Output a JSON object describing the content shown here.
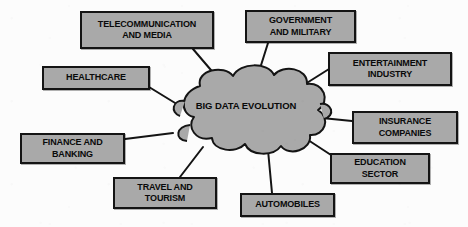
{
  "diagram": {
    "type": "hub-and-spoke",
    "background_color": "#fcfcfc",
    "node_fill_color": "#a9a9a9",
    "node_border_color": "#141414",
    "text_color": "#0a0a0a",
    "connector_color": "#141414"
  },
  "hub": {
    "label": "BIG DATA EVOLUTION",
    "shape": "cloud"
  },
  "nodes": [
    {
      "id": "telecommunication-and-media",
      "label": "TELECOMMUNICATION\nAND MEDIA",
      "x": 80,
      "y": 11,
      "width": 134,
      "height": 38
    },
    {
      "id": "government-and-military",
      "label": "GOVERNMENT\nAND MILITARY",
      "x": 245,
      "y": 10,
      "width": 111,
      "height": 33
    },
    {
      "id": "entertainment-industry",
      "label": "ENTERTAINMENT\nINDUSTRY",
      "x": 328,
      "y": 52,
      "width": 124,
      "height": 34
    },
    {
      "id": "healthcare",
      "label": "HEALTHCARE",
      "x": 42,
      "y": 66,
      "width": 108,
      "height": 24
    },
    {
      "id": "insurance-companies",
      "label": "INSURANCE\nCOMPANIES",
      "x": 352,
      "y": 111,
      "width": 106,
      "height": 33
    },
    {
      "id": "finance-and-banking",
      "label": "FINANCE AND\nBANKING",
      "x": 20,
      "y": 133,
      "width": 105,
      "height": 31
    },
    {
      "id": "education-sector",
      "label": "EDUCATION\nSECTOR",
      "x": 330,
      "y": 153,
      "width": 100,
      "height": 31
    },
    {
      "id": "travel-and-tourism",
      "label": "TRAVEL AND\nTOURISM",
      "x": 113,
      "y": 177,
      "width": 104,
      "height": 32
    },
    {
      "id": "automobiles",
      "label": "AUTOMOBILES",
      "x": 240,
      "y": 193,
      "width": 95,
      "height": 24
    }
  ],
  "connectors": [
    {
      "from": "telecommunication-and-media",
      "to": "hub",
      "x1": 193,
      "y1": 49,
      "x2": 222,
      "y2": 83
    },
    {
      "from": "government-and-military",
      "to": "hub",
      "x1": 268,
      "y1": 43,
      "x2": 257,
      "y2": 78
    },
    {
      "from": "entertainment-industry",
      "to": "hub",
      "x1": 329,
      "y1": 69,
      "x2": 302,
      "y2": 86
    },
    {
      "from": "healthcare",
      "to": "hub",
      "x1": 149,
      "y1": 87,
      "x2": 180,
      "y2": 106
    },
    {
      "from": "insurance-companies",
      "to": "hub",
      "x1": 352,
      "y1": 121,
      "x2": 322,
      "y2": 118
    },
    {
      "from": "finance-and-banking",
      "to": "hub",
      "x1": 125,
      "y1": 139,
      "x2": 173,
      "y2": 133
    },
    {
      "from": "education-sector",
      "to": "hub",
      "x1": 331,
      "y1": 155,
      "x2": 305,
      "y2": 138
    },
    {
      "from": "travel-and-tourism",
      "to": "hub",
      "x1": 180,
      "y1": 177,
      "x2": 203,
      "y2": 147
    },
    {
      "from": "automobiles",
      "to": "hub",
      "x1": 272,
      "y1": 193,
      "x2": 268,
      "y2": 150
    }
  ]
}
